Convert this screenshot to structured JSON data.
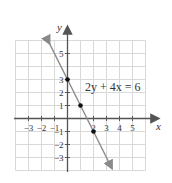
{
  "chart_data": {
    "type": "line",
    "title": "",
    "equation_label": "2y + 4x = 6",
    "xlabel": "x",
    "ylabel": "y",
    "xlim": [
      -4,
      6
    ],
    "ylim": [
      -4,
      6
    ],
    "grid": true,
    "x_ticks": [
      -3,
      -2,
      -1,
      2,
      3,
      4,
      5
    ],
    "x_tick_labels": [
      "−3",
      "−2",
      "−1",
      "2",
      "3",
      "4",
      "5"
    ],
    "y_ticks": [
      5,
      3,
      2,
      1,
      -1,
      -2,
      -3
    ],
    "y_tick_labels": [
      "5",
      "3",
      "2",
      "1",
      "−1",
      "−2",
      "−3"
    ],
    "series": [
      {
        "name": "2y + 4x = 6",
        "slope": -2,
        "intercept": 3,
        "x": [
          -1.4,
          3.4
        ],
        "y": [
          5.8,
          -3.8
        ],
        "color": "#888888"
      }
    ],
    "points": [
      {
        "x": 0,
        "y": 3
      },
      {
        "x": 1,
        "y": 1
      },
      {
        "x": 2,
        "y": -1
      }
    ]
  },
  "colors": {
    "grid": "#d9d9d9",
    "axis": "#555555",
    "line": "#8a8a8a",
    "point": "#111111"
  }
}
